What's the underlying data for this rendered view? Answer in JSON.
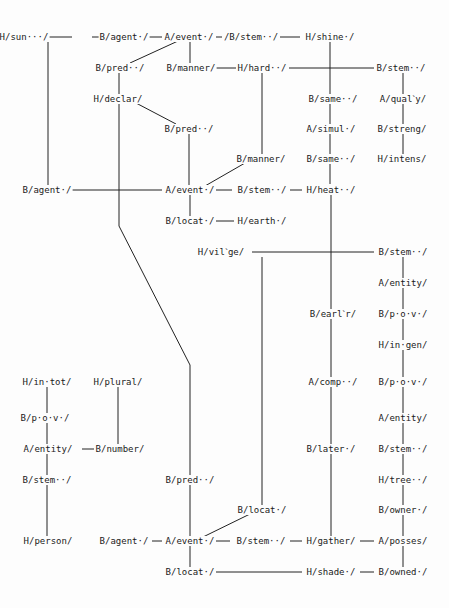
{
  "diagram": {
    "type": "semantic-network",
    "nodes": [
      {
        "id": "n1",
        "label": "H/sun···/",
        "x": 24,
        "y": 37
      },
      {
        "id": "n2",
        "label": "B/agent·/",
        "x": 124,
        "y": 37
      },
      {
        "id": "n3",
        "label": "A/event·/",
        "x": 189,
        "y": 37
      },
      {
        "id": "n4",
        "label": "/B/stem··/",
        "x": 251,
        "y": 37
      },
      {
        "id": "n5",
        "label": "H/shine·/",
        "x": 330,
        "y": 37
      },
      {
        "id": "n6",
        "label": "B/pred··/",
        "x": 120,
        "y": 68
      },
      {
        "id": "n7",
        "label": "B/manner/",
        "x": 191,
        "y": 68
      },
      {
        "id": "n8",
        "label": "H/hard··/",
        "x": 262,
        "y": 68
      },
      {
        "id": "n9",
        "label": "B/stem··/",
        "x": 401,
        "y": 68
      },
      {
        "id": "n10",
        "label": "H/declar/",
        "x": 118,
        "y": 99
      },
      {
        "id": "n11",
        "label": "B/same··/",
        "x": 333,
        "y": 99
      },
      {
        "id": "n12",
        "label": "A/qualˋy/",
        "x": 403,
        "y": 99
      },
      {
        "id": "n13",
        "label": "B/pred··/",
        "x": 189,
        "y": 129
      },
      {
        "id": "n14",
        "label": "A/simul·/",
        "x": 331,
        "y": 129
      },
      {
        "id": "n15",
        "label": "B/streng/",
        "x": 402,
        "y": 129
      },
      {
        "id": "n16",
        "label": "B/manner/",
        "x": 261,
        "y": 159
      },
      {
        "id": "n17",
        "label": "B/same··/",
        "x": 331,
        "y": 159
      },
      {
        "id": "n18",
        "label": "H/intens/",
        "x": 402,
        "y": 159
      },
      {
        "id": "n19",
        "label": "B/agent·/",
        "x": 47,
        "y": 190
      },
      {
        "id": "n20",
        "label": "A/event·/",
        "x": 190,
        "y": 190
      },
      {
        "id": "n21",
        "label": "B/stem··/",
        "x": 262,
        "y": 190
      },
      {
        "id": "n22",
        "label": "H/heat··/",
        "x": 331,
        "y": 190
      },
      {
        "id": "n23",
        "label": "B/locat·/",
        "x": 190,
        "y": 221
      },
      {
        "id": "n24",
        "label": "H/earth·/",
        "x": 262,
        "y": 221
      },
      {
        "id": "n25",
        "label": "H/vilˋge/",
        "x": 221,
        "y": 252
      },
      {
        "id": "n26",
        "label": "B/stem··/",
        "x": 403,
        "y": 252
      },
      {
        "id": "n27",
        "label": "A/entity/",
        "x": 403,
        "y": 283
      },
      {
        "id": "n28",
        "label": "B/earlˋr/",
        "x": 333,
        "y": 314
      },
      {
        "id": "n29",
        "label": "B/p·o·v·/",
        "x": 403,
        "y": 314
      },
      {
        "id": "n30",
        "label": "H/in·gen/",
        "x": 403,
        "y": 345
      },
      {
        "id": "n31",
        "label": "H/in·tot/",
        "x": 47,
        "y": 382
      },
      {
        "id": "n32",
        "label": "H/plural/",
        "x": 118,
        "y": 382
      },
      {
        "id": "n33",
        "label": "A/comp··/",
        "x": 333,
        "y": 382
      },
      {
        "id": "n34",
        "label": "B/p·o·v·/",
        "x": 403,
        "y": 382
      },
      {
        "id": "n35",
        "label": "B/p·o·v·/",
        "x": 45,
        "y": 418
      },
      {
        "id": "n36",
        "label": "A/entity/",
        "x": 403,
        "y": 418
      },
      {
        "id": "n37",
        "label": "A/entity/",
        "x": 48,
        "y": 449
      },
      {
        "id": "n38",
        "label": "B/number/",
        "x": 120,
        "y": 449
      },
      {
        "id": "n39",
        "label": "B/later·/",
        "x": 331,
        "y": 449
      },
      {
        "id": "n40",
        "label": "B/stem··/",
        "x": 403,
        "y": 449
      },
      {
        "id": "n41",
        "label": "B/stem··/",
        "x": 47,
        "y": 480
      },
      {
        "id": "n42",
        "label": "B/pred··/",
        "x": 190,
        "y": 480
      },
      {
        "id": "n43",
        "label": "H/tree··/",
        "x": 403,
        "y": 480
      },
      {
        "id": "n44",
        "label": "B/locat·/",
        "x": 262,
        "y": 510
      },
      {
        "id": "n45",
        "label": "B/owner·/",
        "x": 403,
        "y": 510
      },
      {
        "id": "n46",
        "label": "H/person/",
        "x": 48,
        "y": 541
      },
      {
        "id": "n47",
        "label": "B/agent·/",
        "x": 124,
        "y": 541
      },
      {
        "id": "n48",
        "label": "A/event·/",
        "x": 190,
        "y": 541
      },
      {
        "id": "n49",
        "label": "B/stem··/",
        "x": 261,
        "y": 541
      },
      {
        "id": "n50",
        "label": "H/gather/",
        "x": 331,
        "y": 541
      },
      {
        "id": "n51",
        "label": "A/posses/",
        "x": 403,
        "y": 541
      },
      {
        "id": "n52",
        "label": "B/locat·/",
        "x": 190,
        "y": 572
      },
      {
        "id": "n53",
        "label": "H/shade·/",
        "x": 331,
        "y": 572
      },
      {
        "id": "n54",
        "label": "B/owned·/",
        "x": 403,
        "y": 572
      }
    ],
    "edges": [
      [
        48,
        37,
        72,
        37
      ],
      [
        92,
        37,
        162,
        37
      ],
      [
        216,
        37,
        222,
        37
      ],
      [
        280,
        37,
        300,
        37
      ],
      [
        48,
        190,
        162,
        190
      ],
      [
        48,
        541,
        72,
        541
      ],
      [
        152,
        541,
        162,
        541
      ],
      [
        216,
        541,
        230,
        541
      ],
      [
        290,
        541,
        302,
        541
      ],
      [
        360,
        541,
        374,
        541
      ],
      [
        216,
        572,
        302,
        572
      ],
      [
        360,
        572,
        374,
        572
      ],
      [
        82,
        449,
        94,
        449
      ],
      [
        216,
        190,
        232,
        190
      ],
      [
        290,
        190,
        302,
        190
      ],
      [
        216,
        221,
        234,
        221
      ],
      [
        289,
        68,
        374,
        68
      ],
      [
        252,
        252,
        374,
        252
      ],
      [
        210,
        68,
        236,
        68
      ],
      [
        48,
        42,
        48,
        185
      ],
      [
        190,
        42,
        190,
        63
      ],
      [
        330,
        42,
        330,
        184
      ],
      [
        262,
        73,
        262,
        154
      ],
      [
        403,
        73,
        403,
        94
      ],
      [
        403,
        104,
        403,
        124
      ],
      [
        403,
        134,
        403,
        154
      ],
      [
        119,
        73,
        119,
        94
      ],
      [
        189,
        134,
        189,
        185
      ],
      [
        190,
        195,
        190,
        216
      ],
      [
        262,
        257,
        262,
        505
      ],
      [
        331,
        195,
        331,
        309
      ],
      [
        331,
        319,
        331,
        377
      ],
      [
        331,
        387,
        331,
        444
      ],
      [
        331,
        454,
        331,
        536
      ],
      [
        403,
        257,
        403,
        278
      ],
      [
        403,
        288,
        403,
        309
      ],
      [
        403,
        319,
        403,
        340
      ],
      [
        403,
        350,
        403,
        377
      ],
      [
        403,
        387,
        403,
        413
      ],
      [
        403,
        423,
        403,
        444
      ],
      [
        403,
        454,
        403,
        475
      ],
      [
        403,
        485,
        403,
        505
      ],
      [
        403,
        515,
        403,
        536
      ],
      [
        403,
        546,
        403,
        567
      ],
      [
        47,
        387,
        47,
        413
      ],
      [
        47,
        423,
        47,
        444
      ],
      [
        47,
        454,
        47,
        475
      ],
      [
        47,
        485,
        47,
        536
      ],
      [
        118,
        387,
        118,
        444
      ],
      [
        190,
        485,
        190,
        536
      ],
      [
        190,
        546,
        190,
        567
      ],
      [
        178,
        41,
        130,
        63
      ],
      [
        136,
        103,
        176,
        124
      ],
      [
        245,
        163,
        205,
        186
      ],
      [
        250,
        514,
        203,
        537
      ]
    ],
    "polylines": [
      [
        [
          119,
          104
        ],
        [
          119,
          226
        ],
        [
          190,
          365
        ],
        [
          190,
          475
        ]
      ]
    ]
  }
}
